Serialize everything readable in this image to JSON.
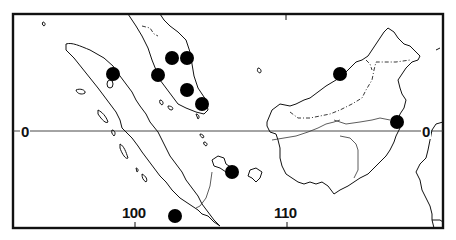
{
  "map": {
    "region": "Sumatra, Malay Peninsula and Borneo",
    "colors": {
      "ink": "#111111",
      "background": "#ffffff",
      "marker": "#000000"
    },
    "labels": {
      "equator_left": "0",
      "equator_right": "0",
      "longitude_100": "100",
      "longitude_110": "110"
    },
    "gridlines": {
      "latitude": [
        0
      ],
      "longitude_ticks": [
        100,
        110
      ]
    },
    "marker_style": "filled-black-circle",
    "markers": [
      {
        "id": 1,
        "landmass": "Sumatra (north)",
        "x": 113,
        "y": 74
      },
      {
        "id": 2,
        "landmass": "Malay Peninsula",
        "x": 172,
        "y": 58
      },
      {
        "id": 3,
        "landmass": "Malay Peninsula",
        "x": 187,
        "y": 58
      },
      {
        "id": 4,
        "landmass": "Malay Peninsula",
        "x": 158,
        "y": 75
      },
      {
        "id": 5,
        "landmass": "Malay Peninsula",
        "x": 187,
        "y": 90
      },
      {
        "id": 6,
        "landmass": "Malay Peninsula (south)",
        "x": 202,
        "y": 104
      },
      {
        "id": 7,
        "landmass": "Borneo (Sarawak coast)",
        "x": 340,
        "y": 74
      },
      {
        "id": 8,
        "landmass": "Borneo (east coast)",
        "x": 397,
        "y": 122
      },
      {
        "id": 9,
        "landmass": "Bangka",
        "x": 232,
        "y": 172
      },
      {
        "id": 10,
        "landmass": "South of Sumatra",
        "x": 175,
        "y": 216
      }
    ]
  }
}
